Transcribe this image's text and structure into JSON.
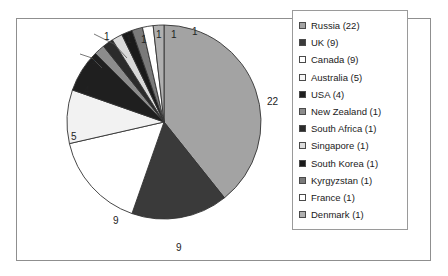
{
  "chart_data": {
    "type": "pie",
    "title": "",
    "categories": [
      "Russia",
      "UK",
      "Canada",
      "Australia",
      "USA",
      "New Zealand",
      "South Africa",
      "Singapore",
      "South Korea",
      "Kyrgyzstan",
      "France",
      "Denmark"
    ],
    "values": [
      22,
      9,
      9,
      5,
      4,
      1,
      1,
      1,
      1,
      1,
      1,
      1
    ],
    "total": 56,
    "start_angle_deg": 0,
    "direction": "clockwise",
    "legend_position": "right",
    "grid": false,
    "slice_colors": [
      "#a3a3a3",
      "#3a3a3a",
      "#ffffff",
      "#f2f2f2",
      "#1f1f1f",
      "#8c8c8c",
      "#2b2b2b",
      "#d9d9d9",
      "#1a1a1a",
      "#7a7a7a",
      "#ffffff",
      "#b0b0b0"
    ],
    "data_labels": [
      {
        "text": "22",
        "value": 22,
        "category": "Russia"
      },
      {
        "text": "9",
        "value": 9,
        "category": "UK"
      },
      {
        "text": "9",
        "value": 9,
        "category": "Canada"
      },
      {
        "text": "5",
        "value": 5,
        "category": "Australia"
      },
      {
        "text": "4",
        "value": 4,
        "category": "USA"
      },
      {
        "text": "1",
        "value": 1,
        "category": "New Zealand"
      },
      {
        "text": "1",
        "value": 1,
        "category": "South Africa"
      },
      {
        "text": "1",
        "value": 1,
        "category": "Singapore"
      },
      {
        "text": "1",
        "value": 1,
        "category": "South Korea"
      },
      {
        "text": "1",
        "value": 1,
        "category": "Kyrgyzstan"
      },
      {
        "text": "1",
        "value": 1,
        "category": "France"
      },
      {
        "text": "1",
        "value": 1,
        "category": "Denmark"
      }
    ]
  },
  "legend": {
    "items": [
      {
        "label": "Russia (22)",
        "color": "#a3a3a3"
      },
      {
        "label": "UK (9)",
        "color": "#3a3a3a"
      },
      {
        "label": "Canada (9)",
        "color": "#ffffff"
      },
      {
        "label": "Australia (5)",
        "color": "#f6f6f6"
      },
      {
        "label": "USA (4)",
        "color": "#1f1f1f"
      },
      {
        "label": "New Zealand (1)",
        "color": "#8c8c8c"
      },
      {
        "label": "South Africa (1)",
        "color": "#2b2b2b"
      },
      {
        "label": "Singapore (1)",
        "color": "#dcdcdc"
      },
      {
        "label": "South Korea (1)",
        "color": "#1a1a1a"
      },
      {
        "label": "Kyrgyzstan (1)",
        "color": "#7a7a7a"
      },
      {
        "label": "France (1)",
        "color": "#ffffff"
      },
      {
        "label": "Denmark (1)",
        "color": "#b0b0b0"
      }
    ]
  },
  "labels": {
    "l22": "22",
    "l9a": "9",
    "l9b": "9",
    "l5": "5",
    "l4": "4",
    "l1a": "1",
    "l1b": "1",
    "l1c": "1",
    "l1d": "1",
    "l1e": "1",
    "l1f": "1"
  }
}
